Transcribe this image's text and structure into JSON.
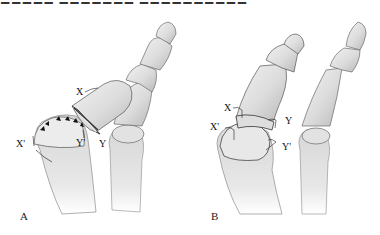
{
  "header": {
    "cropped_text": "■■■■■ ■■■■■■■ ■■■■■■■■■■ ■ ■ ■ ■ ■ ■"
  },
  "panels": [
    {
      "id": "A",
      "label": "A",
      "markers": {
        "x": "X",
        "y": "Y",
        "x_prime": "X'",
        "y_prime": "Y'"
      },
      "arrowheads": 6
    },
    {
      "id": "B",
      "label": "B",
      "markers": {
        "x": "X",
        "y": "Y",
        "x_prime": "X'",
        "y_prime": "Y'"
      }
    }
  ],
  "colors": {
    "bone_fill": "#e6e6e6",
    "bone_shadow": "#bdbdbd",
    "outline": "#555555",
    "label": "#111111"
  }
}
